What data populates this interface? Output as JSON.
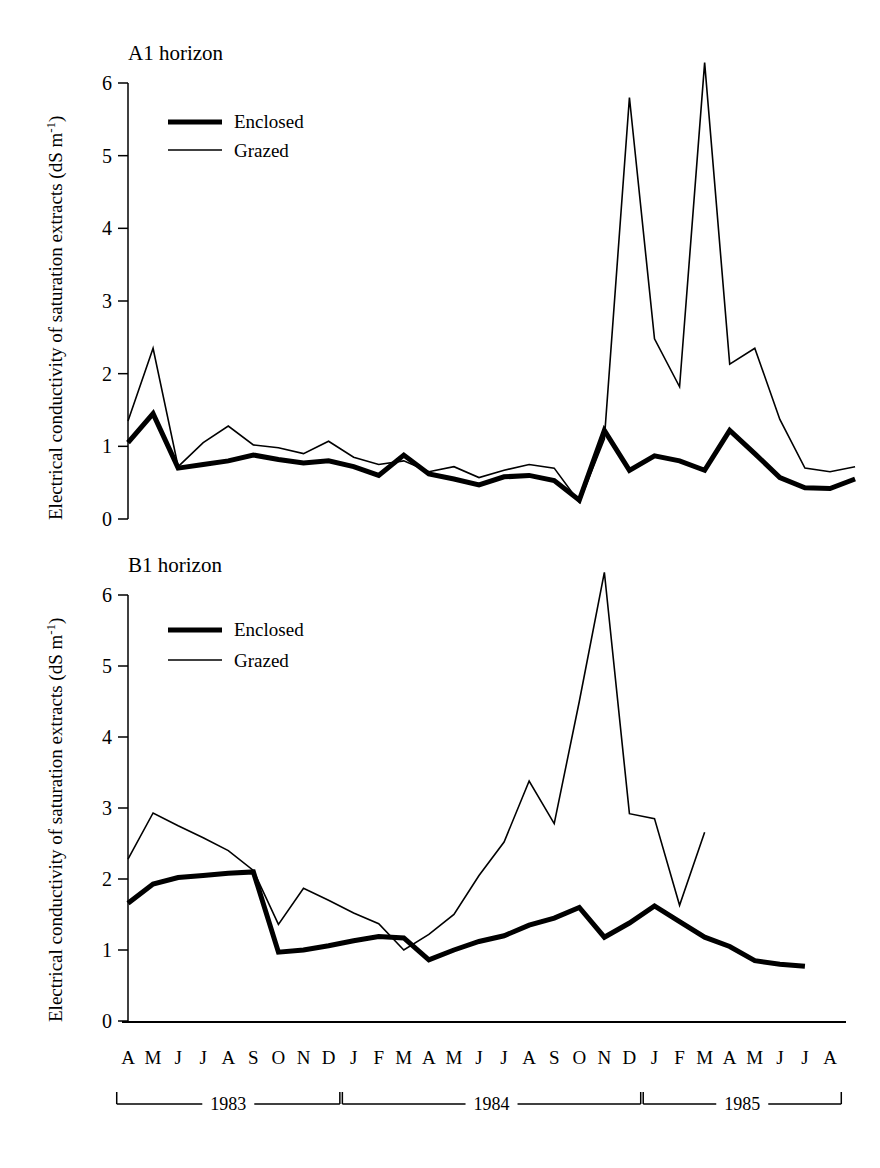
{
  "figure": {
    "y_axis_label": "Electrical conductivity of saturation extracts (dS m",
    "y_axis_label_sup": "-1",
    "y_axis_label_tail": ")",
    "line_color": "#000000"
  },
  "panels": [
    {
      "title": "A1 horizon"
    },
    {
      "title": "B1 horizon"
    }
  ],
  "legend": {
    "enclosed_label": "Enclosed",
    "grazed_label": "Grazed"
  },
  "axis": {
    "y_ticks": [
      "0",
      "1",
      "2",
      "3",
      "4",
      "5",
      "6"
    ],
    "month_labels": [
      "A",
      "M",
      "J",
      "J",
      "A",
      "S",
      "O",
      "N",
      "D",
      "J",
      "F",
      "M",
      "A",
      "M",
      "J",
      "J",
      "A",
      "S",
      "O",
      "N",
      "D",
      "J",
      "F",
      "M",
      "A",
      "M",
      "J",
      "J",
      "A"
    ],
    "year_brackets": [
      {
        "label": "1983",
        "start_index": 0,
        "end_index": 8
      },
      {
        "label": "1984",
        "start_index": 9,
        "end_index": 20
      },
      {
        "label": "1985",
        "start_index": 21,
        "end_index": 28
      }
    ]
  },
  "chart_data": [
    {
      "type": "line",
      "title": "A1 horizon",
      "xlabel": "",
      "ylabel": "Electrical conductivity of saturation extracts (dS m-1)",
      "ylim": [
        0,
        6.5
      ],
      "grid": false,
      "legend_position": "upper-left-inside",
      "categories": [
        "A 1983",
        "M 1983",
        "J 1983",
        "J 1983",
        "A 1983",
        "S 1983",
        "O 1983",
        "N 1983",
        "D 1983",
        "J 1984",
        "F 1984",
        "M 1984",
        "A 1984",
        "M 1984",
        "J 1984",
        "J 1984",
        "A 1984",
        "S 1984",
        "O 1984",
        "N 1984",
        "D 1984",
        "J 1985",
        "F 1985",
        "M 1985",
        "A 1985",
        "M 1985",
        "J 1985",
        "J 1985",
        "A 1985"
      ],
      "series": [
        {
          "name": "Enclosed",
          "style": "thick",
          "values": [
            1.05,
            1.45,
            0.7,
            0.75,
            0.8,
            0.88,
            0.82,
            0.77,
            0.8,
            0.72,
            0.6,
            0.88,
            0.62,
            0.55,
            0.47,
            0.58,
            0.6,
            0.53,
            0.26,
            1.22,
            0.67,
            0.87,
            0.8,
            0.67,
            1.22,
            0.9,
            0.57,
            0.43,
            0.42,
            0.55
          ]
        },
        {
          "name": "Grazed",
          "style": "thin",
          "values": [
            1.35,
            2.35,
            0.72,
            1.05,
            1.28,
            1.02,
            0.98,
            0.9,
            1.07,
            0.85,
            0.75,
            0.8,
            0.65,
            0.72,
            0.57,
            0.67,
            0.75,
            0.7,
            0.23,
            1.1,
            5.8,
            2.48,
            1.82,
            6.28,
            2.13,
            2.35,
            1.37,
            0.7,
            0.65,
            0.72
          ]
        }
      ]
    },
    {
      "type": "line",
      "title": "B1 horizon",
      "xlabel": "",
      "ylabel": "Electrical conductivity of saturation extracts (dS m-1)",
      "ylim": [
        0,
        6.5
      ],
      "grid": false,
      "legend_position": "upper-left-inside",
      "categories": [
        "A 1983",
        "M 1983",
        "J 1983",
        "J 1983",
        "A 1983",
        "S 1983",
        "O 1983",
        "N 1983",
        "D 1983",
        "J 1984",
        "F 1984",
        "M 1984",
        "A 1984",
        "M 1984",
        "J 1984",
        "J 1984",
        "A 1984",
        "S 1984",
        "O 1984",
        "N 1984",
        "D 1984",
        "J 1985",
        "F 1985",
        "M 1985",
        "A 1985",
        "M 1985",
        "J 1985",
        "J 1985",
        "A 1985"
      ],
      "series": [
        {
          "name": "Enclosed",
          "style": "thick",
          "values": [
            1.66,
            1.93,
            2.02,
            2.05,
            2.08,
            2.1,
            0.97,
            1.0,
            1.06,
            1.13,
            1.19,
            1.17,
            0.86,
            1.0,
            1.12,
            1.2,
            1.35,
            1.45,
            1.6,
            1.18,
            1.38,
            1.62,
            1.4,
            1.18,
            1.05,
            0.85,
            0.8,
            0.77
          ]
        },
        {
          "name": "Grazed",
          "style": "thin",
          "values": [
            2.28,
            2.93,
            2.75,
            2.58,
            2.4,
            2.12,
            1.36,
            1.87,
            1.7,
            1.52,
            1.37,
            1.0,
            1.22,
            1.5,
            2.05,
            2.52,
            3.38,
            2.78,
            4.5,
            6.32,
            2.92,
            2.85,
            1.63,
            2.66
          ]
        }
      ]
    }
  ]
}
